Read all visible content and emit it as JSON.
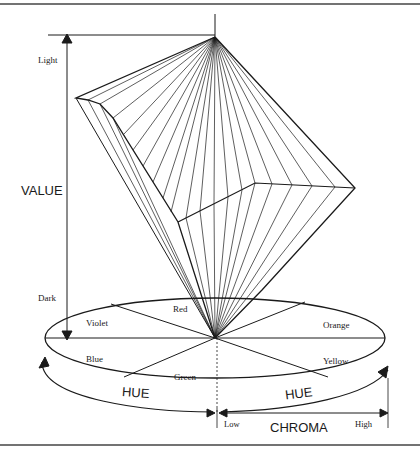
{
  "figure": {
    "axes": {
      "value": {
        "label": "VALUE",
        "top_label": "Light",
        "bottom_label": "Dark"
      },
      "hue": {
        "label_left": "HUE",
        "label_right": "HUE"
      },
      "chroma": {
        "label": "CHROMA",
        "low_label": "Low",
        "high_label": "High"
      }
    },
    "hue_segments": [
      {
        "name": "Red"
      },
      {
        "name": "Orange"
      },
      {
        "name": "Yellow"
      },
      {
        "name": "Green"
      },
      {
        "name": "Blue"
      },
      {
        "name": "Violet"
      }
    ],
    "colors": {
      "line": "#1a1a1a",
      "background": "#ffffff",
      "border": "#333333"
    }
  }
}
